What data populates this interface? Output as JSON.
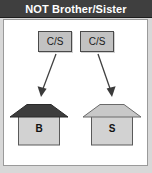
{
  "header": {
    "title": "NOT Brother/Sister",
    "background_color": "#3f3f3f",
    "text_color": "#ffffff"
  },
  "panel": {
    "background_color": "#ffffff",
    "border_color": "#9a9a9a"
  },
  "diagram": {
    "type": "relationship-diagram",
    "nodes": [
      {
        "id": "cs-left",
        "label": "C/S",
        "fill_color": "#c2c2c2",
        "border_color": "#4a4a4a"
      },
      {
        "id": "cs-right",
        "label": "C/S",
        "fill_color": "#c2c2c2",
        "border_color": "#4a4a4a"
      }
    ],
    "arrows": [
      {
        "id": "arrow-left",
        "from": "cs-left",
        "to": "house-left",
        "direction": "down-left",
        "color": "#404040"
      },
      {
        "id": "arrow-right",
        "from": "cs-right",
        "to": "house-right",
        "direction": "down-right",
        "color": "#404040"
      }
    ],
    "houses": [
      {
        "id": "house-left",
        "label": "B",
        "roof_color": "#3d3d3d",
        "body_color": "#d2d2d2",
        "border_color": "#5a5a5a"
      },
      {
        "id": "house-right",
        "label": "S",
        "roof_color": "#c8c8c8",
        "body_color": "#d2d2d2",
        "border_color": "#5a5a5a"
      }
    ]
  }
}
